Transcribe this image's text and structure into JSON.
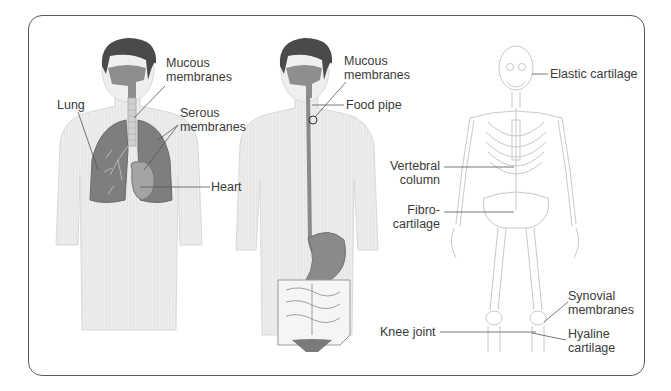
{
  "diagram": {
    "frame": {
      "border_color": "#5a5a5a",
      "background": "#ffffff"
    },
    "colors": {
      "skin": "#ececec",
      "skin_outline": "#d6d6d6",
      "hair": "#4a4a4a",
      "organ": "#8a8a8a",
      "organ_light": "#a6a6a6",
      "bone_outline": "#c8c8c8",
      "leader_line": "#555555",
      "label_text": "#3a3a3a"
    },
    "figures": [
      {
        "id": "respiratory",
        "description": "Male torso with lungs, trachea and heart",
        "labels": [
          {
            "text_lines": [
              "Mucous",
              "membranes"
            ],
            "x": 166,
            "y": 64
          },
          {
            "text_lines": [
              "Lung"
            ],
            "x": 57,
            "y": 99
          },
          {
            "text_lines": [
              "Serous",
              "membranes"
            ],
            "x": 180,
            "y": 106
          },
          {
            "text_lines": [
              "Heart"
            ],
            "x": 211,
            "y": 180
          }
        ]
      },
      {
        "id": "digestive",
        "description": "Male torso with food pipe, stomach and intestines",
        "labels": [
          {
            "text_lines": [
              "Mucous",
              "membranes"
            ],
            "x": 343,
            "y": 61
          },
          {
            "text_lines": [
              "Food pipe"
            ],
            "x": 346,
            "y": 98
          }
        ]
      },
      {
        "id": "skeleton",
        "description": "Full human skeleton",
        "labels": [
          {
            "text_lines": [
              "Elastic cartilage"
            ],
            "x": 549,
            "y": 67
          },
          {
            "text_lines": [
              "Vertebral",
              "column"
            ],
            "x": 390,
            "y": 165,
            "align": "right"
          },
          {
            "text_lines": [
              "Fibro-",
              "cartilage"
            ],
            "x": 408,
            "y": 206,
            "align": "right"
          },
          {
            "text_lines": [
              "Synovial",
              "membranes"
            ],
            "x": 568,
            "y": 289
          },
          {
            "text_lines": [
              "Knee joint"
            ],
            "x": 380,
            "y": 327
          },
          {
            "text_lines": [
              "Hyaline",
              "cartilage"
            ],
            "x": 568,
            "y": 332
          }
        ]
      }
    ]
  },
  "labels": {
    "resp_mucous_1": "Mucous",
    "resp_mucous_2": "membranes",
    "resp_lung": "Lung",
    "resp_serous_1": "Serous",
    "resp_serous_2": "membranes",
    "resp_heart": "Heart",
    "dig_mucous_1": "Mucous",
    "dig_mucous_2": "membranes",
    "dig_food_pipe": "Food pipe",
    "skel_elastic": "Elastic cartilage",
    "skel_vertebral_1": "Vertebral",
    "skel_vertebral_2": "column",
    "skel_fibro_1": "Fibro-",
    "skel_fibro_2": "cartilage",
    "skel_synovial_1": "Synovial",
    "skel_synovial_2": "membranes",
    "skel_knee": "Knee joint",
    "skel_hyaline_1": "Hyaline",
    "skel_hyaline_2": "cartilage"
  }
}
